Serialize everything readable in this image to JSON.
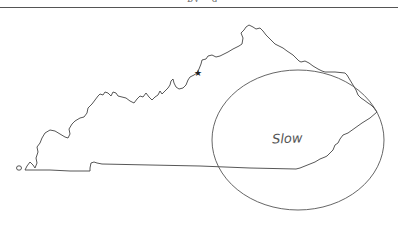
{
  "page": {
    "header_text": "· · · · by · g · · ·",
    "has_rule": true
  },
  "map": {
    "subject": "Kentucky state outline (hand-drawn)",
    "marker": {
      "icon": "star-icon",
      "glyph": "★",
      "x": 198,
      "y": 72
    },
    "region": {
      "shape": "ellipse",
      "cx": 298,
      "cy": 140,
      "rx": 86,
      "ry": 70,
      "label": "Slow"
    },
    "stroke_color": "#444444",
    "background_color": "#ffffff"
  }
}
